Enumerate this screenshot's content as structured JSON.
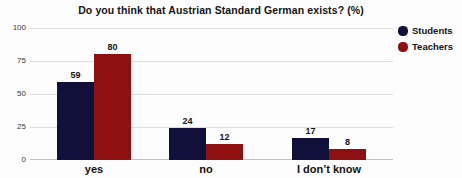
{
  "title": "Do you think that Austrian Standard German exists? (%)",
  "chart_data": {
    "type": "bar",
    "title": "Do you think that Austrian Standard German exists? (%)",
    "categories": [
      "yes",
      "no",
      "I don’t know"
    ],
    "series": [
      {
        "name": "Students",
        "color": "#10103a",
        "values": [
          59,
          24,
          17
        ]
      },
      {
        "name": "Teachers",
        "color": "#8e1010",
        "values": [
          80,
          12,
          8
        ]
      }
    ],
    "ylabel": "",
    "xlabel": "",
    "ylim": [
      0,
      100
    ],
    "yticks": [
      0,
      25,
      50,
      75,
      100
    ],
    "grid": true,
    "show_value_labels": true,
    "legend_position": "top-right"
  },
  "legend": {
    "items": [
      {
        "label": "Students",
        "color": "#10103a"
      },
      {
        "label": "Teachers",
        "color": "#8e1010"
      }
    ]
  },
  "colors": {
    "students": "#10103a",
    "teachers": "#8e1010",
    "gridline": "#dddddd",
    "axis_line": "#c2c2c2",
    "text": "#141414",
    "background": "#fdfdfd"
  }
}
